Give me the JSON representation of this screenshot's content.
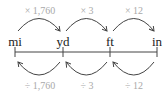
{
  "diagram": {
    "title": "",
    "units": [
      {
        "label": "mi",
        "x": 15
      },
      {
        "label": "yd",
        "x": 63
      },
      {
        "label": "ft",
        "x": 110
      },
      {
        "label": "in",
        "x": 157
      }
    ],
    "multiply": [
      {
        "label": "× 1,760",
        "from": "mi",
        "to": "yd"
      },
      {
        "label": "× 3",
        "from": "yd",
        "to": "ft"
      },
      {
        "label": "× 12",
        "from": "ft",
        "to": "in"
      }
    ],
    "divide": [
      {
        "label": "÷ 1,760",
        "from": "yd",
        "to": "mi"
      },
      {
        "label": "÷ 3",
        "from": "ft",
        "to": "yd"
      },
      {
        "label": "÷ 12",
        "from": "in",
        "to": "ft"
      }
    ],
    "colors": {
      "line": "#444444",
      "label": "#a9a9a9",
      "unit": "#222222"
    }
  }
}
